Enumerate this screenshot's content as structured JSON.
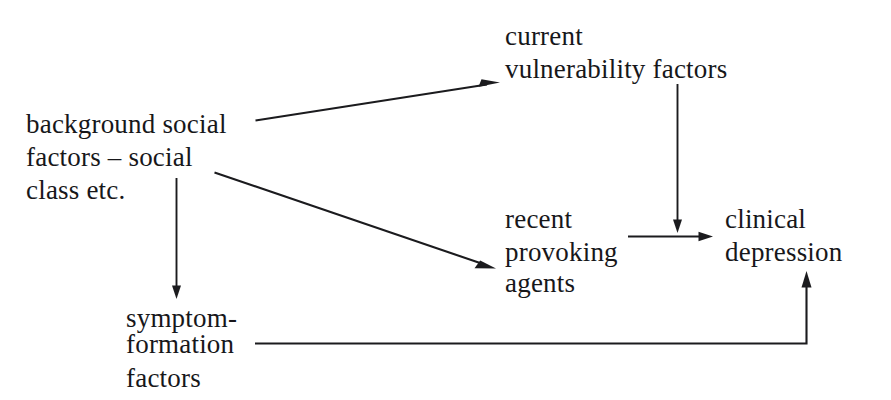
{
  "diagram": {
    "background_color": "#ffffff",
    "ink_color": "#17171a",
    "nodes": [
      {
        "id": "background-social-factors",
        "name": "background-social-factors-node",
        "lines": [
          "background social",
          "factors – social",
          "class etc."
        ]
      },
      {
        "id": "current-vulnerability-factors",
        "name": "current-vulnerability-factors-node",
        "lines": [
          "current",
          "vulnerability factors"
        ]
      },
      {
        "id": "recent-provoking-agents",
        "name": "recent-provoking-agents-node",
        "lines": [
          "recent",
          "provoking",
          "agents"
        ]
      },
      {
        "id": "clinical-depression",
        "name": "clinical-depression-node",
        "lines": [
          "clinical",
          "depression"
        ]
      },
      {
        "id": "symptom-formation-factors",
        "name": "symptom-formation-factors-node",
        "lines": [
          "symptom-",
          "formation",
          "factors"
        ]
      }
    ],
    "edges": [
      {
        "id": "background-to-vulnerability",
        "name": "arrow-background-to-vulnerability",
        "from": "background-social-factors",
        "to": "current-vulnerability-factors",
        "style": "diagonal-up-right",
        "arrowhead": true
      },
      {
        "id": "background-to-provoking",
        "name": "arrow-background-to-provoking",
        "from": "background-social-factors",
        "to": "recent-provoking-agents",
        "style": "diagonal-down-right",
        "arrowhead": true
      },
      {
        "id": "background-to-symptom-formation",
        "name": "arrow-background-to-symptom-formation",
        "from": "background-social-factors",
        "to": "symptom-formation-factors",
        "style": "vertical-down",
        "arrowhead": true
      },
      {
        "id": "vulnerability-to-depression",
        "name": "arrow-vulnerability-to-depression",
        "from": "current-vulnerability-factors",
        "to": "clinical-depression",
        "style": "vertical-down",
        "arrowhead": true
      },
      {
        "id": "provoking-to-depression",
        "name": "arrow-provoking-to-depression",
        "from": "recent-provoking-agents",
        "to": "clinical-depression",
        "style": "horizontal-right",
        "arrowhead": true
      },
      {
        "id": "symptom-formation-to-depression",
        "name": "arrow-symptom-formation-to-depression",
        "from": "symptom-formation-factors",
        "to": "clinical-depression",
        "style": "elbow-right-then-up",
        "arrowhead": true
      }
    ]
  }
}
